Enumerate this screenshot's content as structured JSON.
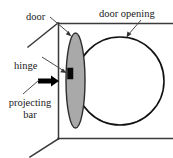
{
  "diagram": {
    "colors": {
      "door_fill": "#a9a9a9",
      "door_stroke": "#2e2e2e",
      "wall_stroke": "#3a3a3a",
      "circle_stroke": "#111111",
      "hinge_fill": "#0a0a0a",
      "bar_fill": "#000000",
      "leader_stroke": "#4a4a4a",
      "background": "#ffffff",
      "text": "#1a1a1a"
    },
    "labels": {
      "door": "door",
      "door_opening": "door opening",
      "hinge": "hinge",
      "projecting_bar_line1": "projecting",
      "projecting_bar_line2": "bar"
    }
  }
}
